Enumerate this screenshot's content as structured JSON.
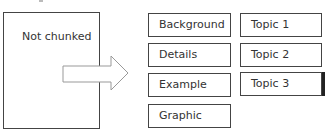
{
  "diagram": {
    "source": {
      "label": "Not chunked"
    },
    "arrow": {
      "direction": "right",
      "icon": "right-arrow-icon"
    },
    "chunks_left": [
      {
        "label": "Background"
      },
      {
        "label": "Details"
      },
      {
        "label": "Example"
      },
      {
        "label": "Graphic"
      }
    ],
    "chunks_right": [
      {
        "label": "Topic 1"
      },
      {
        "label": "Topic 2"
      },
      {
        "label": "Topic 3"
      }
    ],
    "colors": {
      "border": "#444444",
      "text": "#333333",
      "arrow_stroke": "#999999",
      "background": "#ffffff"
    }
  }
}
